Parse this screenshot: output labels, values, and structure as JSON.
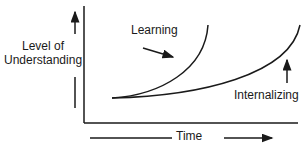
{
  "diagram": {
    "y_axis_label_line1": "Level of",
    "y_axis_label_line2": "Understanding",
    "x_axis_label": "Time",
    "curves": [
      {
        "name": "Learning",
        "shape": "steep exponential rise"
      },
      {
        "name": "Internalizing",
        "shape": "gradual exponential rise"
      }
    ],
    "curve_labels": {
      "learning": "Learning",
      "internalizing": "Internalizing"
    },
    "line_color": "#1a1a1a"
  }
}
